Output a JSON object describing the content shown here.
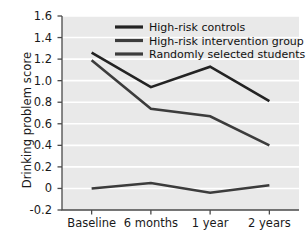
{
  "chart_data": {
    "type": "line",
    "title": "",
    "xlabel": "",
    "ylabel": "Drinking problem score",
    "categories": [
      "Baseline",
      "6 months",
      "1 year",
      "2 years"
    ],
    "ylim": [
      -0.2,
      1.6
    ],
    "yticks": [
      1.6,
      1.4,
      1.2,
      1.0,
      0.8,
      0.6,
      0.4,
      0.2,
      0,
      -0.2
    ],
    "ytick_labels": [
      "1.6",
      "1.4",
      "1.2",
      "1.0",
      "0.8",
      "0.6",
      "0.4",
      "0.2",
      "0",
      "-0.2"
    ],
    "grid": true,
    "grid_axis": "y",
    "grid_color": "#ffffff",
    "plot_background": "#e9e9e9",
    "legend_position": "top-center",
    "series": [
      {
        "name": "High-risk controls",
        "values": [
          1.26,
          0.94,
          1.13,
          0.81
        ],
        "color": "#232323",
        "line_width": 2.6
      },
      {
        "name": "High-risk intervention group",
        "values": [
          1.19,
          0.74,
          0.67,
          0.4
        ],
        "color": "#3c3c3c",
        "line_width": 2.6
      },
      {
        "name": "Randomly selected students",
        "values": [
          0.0,
          0.05,
          -0.04,
          0.03
        ],
        "color": "#3c3c3c",
        "line_width": 2.6
      }
    ]
  },
  "axis": {
    "ylabel": "Drinking problem score",
    "line_color": "#4a4a4a"
  },
  "legend": {
    "items": [
      {
        "label": "High-risk controls",
        "color": "#232323"
      },
      {
        "label": "High-risk intervention group",
        "color": "#3c3c3c"
      },
      {
        "label": "Randomly selected students",
        "color": "#3c3c3c"
      }
    ]
  }
}
